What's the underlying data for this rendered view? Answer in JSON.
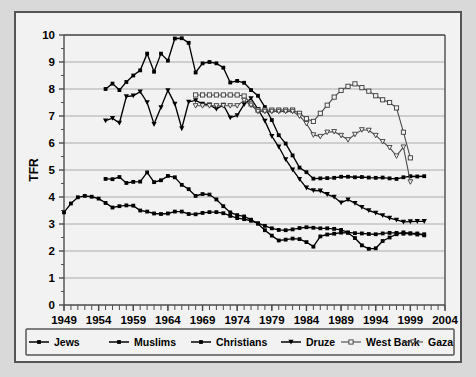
{
  "chart_data": {
    "type": "line",
    "title": "",
    "xlabel": "",
    "ylabel": "TFR",
    "xlim": [
      1949,
      2004
    ],
    "ylim": [
      0,
      10
    ],
    "ytick_labels": [
      "0",
      "1",
      "2",
      "3",
      "4",
      "5",
      "6",
      "7",
      "8",
      "9",
      "10"
    ],
    "xtick_labels": [
      "1949",
      "1954",
      "1959",
      "1964",
      "1969",
      "1974",
      "1979",
      "1984",
      "1989",
      "1994",
      "1999",
      "2004"
    ],
    "grid": "horizontal",
    "legend_position": "bottom",
    "series": [
      {
        "name": "Jews",
        "marker": "filled-square",
        "x": [
          1949,
          1950,
          1951,
          1952,
          1953,
          1954,
          1955,
          1956,
          1957,
          1958,
          1959,
          1960,
          1961,
          1962,
          1963,
          1964,
          1965,
          1966,
          1967,
          1968,
          1969,
          1970,
          1971,
          1972,
          1973,
          1974,
          1975,
          1976,
          1977,
          1978,
          1979,
          1980,
          1981,
          1982,
          1983,
          1984,
          1985,
          1986,
          1987,
          1988,
          1989,
          1990,
          1991,
          1992,
          1993,
          1994,
          1995,
          1996,
          1997,
          1998,
          1999,
          2000,
          2001
        ],
        "values": [
          3.43,
          3.76,
          3.99,
          4.04,
          4.01,
          3.94,
          3.78,
          3.61,
          3.66,
          3.69,
          3.68,
          3.5,
          3.46,
          3.39,
          3.37,
          3.39,
          3.46,
          3.46,
          3.37,
          3.36,
          3.41,
          3.44,
          3.44,
          3.4,
          3.3,
          3.22,
          3.18,
          3.12,
          3.03,
          2.93,
          2.84,
          2.78,
          2.77,
          2.8,
          2.85,
          2.88,
          2.86,
          2.84,
          2.84,
          2.82,
          2.78,
          2.69,
          2.66,
          2.65,
          2.63,
          2.62,
          2.65,
          2.67,
          2.67,
          2.64,
          2.65,
          2.65,
          2.58
        ]
      },
      {
        "name": "Muslims",
        "marker": "filled-square",
        "x": [
          1955,
          1956,
          1957,
          1958,
          1959,
          1960,
          1961,
          1962,
          1963,
          1964,
          1965,
          1966,
          1967,
          1968,
          1969,
          1970,
          1971,
          1972,
          1973,
          1974,
          1975,
          1976,
          1977,
          1978,
          1979,
          1980,
          1981,
          1982,
          1983,
          1984,
          1985,
          1986,
          1987,
          1988,
          1989,
          1990,
          1991,
          1992,
          1993,
          1994,
          1995,
          1996,
          1997,
          1998,
          1999,
          2000,
          2001
        ],
        "values": [
          8.0,
          8.2,
          7.96,
          8.26,
          8.5,
          8.69,
          9.31,
          8.64,
          9.31,
          9.05,
          9.87,
          9.88,
          9.71,
          8.61,
          8.95,
          9.0,
          8.95,
          8.79,
          8.24,
          8.3,
          8.23,
          7.96,
          7.75,
          7.33,
          6.85,
          6.29,
          5.98,
          5.54,
          5.09,
          4.92,
          4.68,
          4.69,
          4.7,
          4.71,
          4.75,
          4.75,
          4.73,
          4.74,
          4.72,
          4.71,
          4.72,
          4.69,
          4.67,
          4.73,
          4.77,
          4.76,
          4.77
        ]
      },
      {
        "name": "Christians",
        "marker": "filled-square",
        "x": [
          1955,
          1956,
          1957,
          1958,
          1959,
          1960,
          1961,
          1962,
          1963,
          1964,
          1965,
          1966,
          1967,
          1968,
          1969,
          1970,
          1971,
          1972,
          1973,
          1974,
          1975,
          1976,
          1977,
          1978,
          1979,
          1980,
          1981,
          1982,
          1983,
          1984,
          1985,
          1986,
          1987,
          1988,
          1989,
          1990,
          1991,
          1992,
          1993,
          1994,
          1995,
          1996,
          1997,
          1998,
          1999,
          2000,
          2001
        ],
        "values": [
          4.67,
          4.66,
          4.74,
          4.52,
          4.56,
          4.57,
          4.91,
          4.55,
          4.62,
          4.78,
          4.73,
          4.45,
          4.29,
          4.04,
          4.11,
          4.09,
          3.91,
          3.66,
          3.43,
          3.33,
          3.28,
          3.16,
          3.01,
          2.77,
          2.57,
          2.39,
          2.42,
          2.46,
          2.44,
          2.33,
          2.16,
          2.54,
          2.61,
          2.64,
          2.68,
          2.67,
          2.48,
          2.21,
          2.08,
          2.1,
          2.37,
          2.5,
          2.62,
          2.69,
          2.65,
          2.61,
          2.62
        ]
      },
      {
        "name": "Druze",
        "marker": "filled-triangle-down",
        "x": [
          1955,
          1956,
          1957,
          1958,
          1959,
          1960,
          1961,
          1962,
          1963,
          1964,
          1965,
          1966,
          1967,
          1968,
          1969,
          1970,
          1971,
          1972,
          1973,
          1974,
          1975,
          1976,
          1977,
          1978,
          1979,
          1980,
          1981,
          1982,
          1983,
          1984,
          1985,
          1986,
          1987,
          1988,
          1989,
          1990,
          1991,
          1992,
          1993,
          1994,
          1995,
          1996,
          1997,
          1998,
          1999,
          2000,
          2001
        ],
        "values": [
          6.83,
          6.92,
          6.74,
          7.72,
          7.75,
          7.9,
          7.5,
          6.7,
          7.32,
          7.95,
          7.45,
          6.54,
          7.52,
          7.58,
          7.45,
          7.42,
          7.26,
          7.41,
          6.94,
          7.02,
          7.43,
          7.65,
          7.25,
          6.82,
          6.25,
          5.86,
          5.39,
          5.01,
          4.66,
          4.34,
          4.24,
          4.23,
          4.1,
          4.0,
          3.79,
          3.9,
          3.77,
          3.62,
          3.5,
          3.41,
          3.32,
          3.22,
          3.15,
          3.08,
          3.09,
          3.1,
          3.1
        ]
      },
      {
        "name": "West Bank",
        "marker": "open-square",
        "x": [
          1968,
          1969,
          1970,
          1971,
          1972,
          1973,
          1974,
          1975,
          1976,
          1977,
          1978,
          1979,
          1980,
          1981,
          1982,
          1983,
          1984,
          1985,
          1986,
          1987,
          1988,
          1989,
          1990,
          1991,
          1992,
          1993,
          1994,
          1995,
          1996,
          1997,
          1998,
          1999
        ],
        "values": [
          7.78,
          7.78,
          7.78,
          7.78,
          7.78,
          7.78,
          7.78,
          7.74,
          7.45,
          7.22,
          7.22,
          7.22,
          7.22,
          7.22,
          7.22,
          7.1,
          6.9,
          6.8,
          7.1,
          7.4,
          7.7,
          7.95,
          8.1,
          8.19,
          8.05,
          7.92,
          7.75,
          7.6,
          7.5,
          7.3,
          6.4,
          5.45
        ]
      },
      {
        "name": "Gaza",
        "marker": "open-triangle",
        "x": [
          1968,
          1969,
          1970,
          1971,
          1972,
          1973,
          1974,
          1975,
          1976,
          1977,
          1978,
          1979,
          1980,
          1981,
          1982,
          1983,
          1984,
          1985,
          1986,
          1987,
          1988,
          1989,
          1990,
          1991,
          1992,
          1993,
          1994,
          1995,
          1996,
          1997,
          1998,
          1999
        ],
        "values": [
          7.38,
          7.38,
          7.38,
          7.38,
          7.38,
          7.38,
          7.38,
          7.58,
          7.4,
          7.17,
          7.17,
          7.17,
          7.17,
          7.17,
          7.17,
          7.0,
          6.72,
          6.3,
          6.24,
          6.4,
          6.42,
          6.28,
          6.12,
          6.32,
          6.49,
          6.47,
          6.28,
          6.05,
          5.83,
          5.52,
          5.85,
          4.56
        ]
      }
    ]
  },
  "legend": {
    "items": [
      {
        "label": "Jews"
      },
      {
        "label": "Muslims"
      },
      {
        "label": "Christians"
      },
      {
        "label": "Druze"
      },
      {
        "label": "West Bank"
      },
      {
        "label": "Gaza"
      }
    ]
  },
  "colors": {
    "background": "#d9d9d9",
    "plot_background": "#f2f2f2",
    "series": "#000000",
    "gridline": "#9a9a9a",
    "axis": "#4d4d4d"
  }
}
